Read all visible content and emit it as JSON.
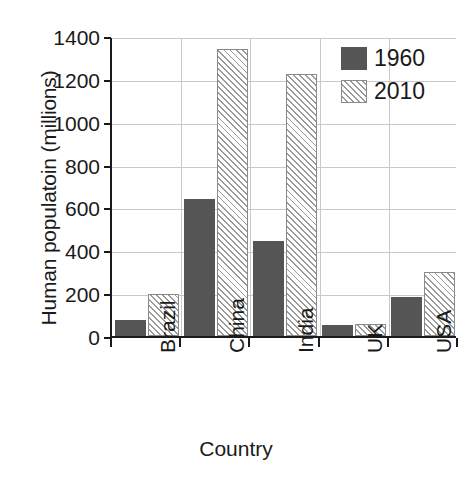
{
  "chart_data": {
    "type": "bar",
    "title": "",
    "xlabel": "Country",
    "ylabel": "Human populatoin (millions)",
    "categories": [
      "Brazil",
      "China",
      "India",
      "UK",
      "USA"
    ],
    "series": [
      {
        "name": "1960",
        "values": [
          75,
          640,
          445,
          52,
          180
        ],
        "color": "#555555",
        "fill": "solid"
      },
      {
        "name": "2010",
        "values": [
          195,
          1340,
          1225,
          55,
          300
        ],
        "color": "#ffffff",
        "fill": "diagonal-hatch"
      }
    ],
    "ylim": [
      0,
      1400
    ],
    "yticks": [
      0,
      200,
      400,
      600,
      800,
      1000,
      1200,
      1400
    ],
    "ytick_labels": [
      "0",
      "200",
      "400",
      "600",
      "800",
      "1000",
      "1200",
      "1400"
    ],
    "grid": "horizontal-and-vertical",
    "legend_position": "top-right",
    "xtick_label_rotation": 90
  },
  "legend": {
    "entries": [
      {
        "label": "1960"
      },
      {
        "label": "2010"
      }
    ]
  }
}
